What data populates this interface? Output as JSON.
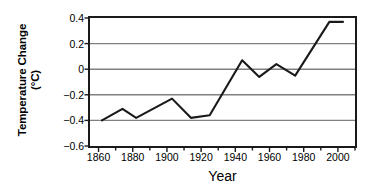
{
  "chart_data": {
    "type": "line",
    "title": "",
    "xlabel": "Year",
    "ylabel": "Temperature Change",
    "ylabel_units": "(°C)",
    "xlim": [
      1855,
      2010
    ],
    "ylim": [
      -0.6,
      0.4
    ],
    "grid": true,
    "grid_axis": "y",
    "legend": "none",
    "xticks": [
      1860,
      1880,
      1900,
      1920,
      1940,
      1960,
      1980,
      2000
    ],
    "xtick_labels": [
      "1860",
      "1880",
      "1900",
      "1920",
      "1940",
      "1960",
      "1980",
      "2000"
    ],
    "xminor_tick_interval": 10,
    "yticks": [
      0.4,
      0.2,
      0,
      -0.2,
      -0.4,
      -0.6
    ],
    "ytick_labels": [
      "0.4",
      "0.2",
      "0",
      "−0.2",
      "−0.4",
      "−0.6"
    ],
    "series": [
      {
        "name": "Global temperature anomaly",
        "color": "#1a1a1a",
        "x": [
          1862,
          1874,
          1882,
          1903,
          1914,
          1925,
          1944,
          1954,
          1964,
          1975,
          1995,
          2003
        ],
        "values": [
          -0.4,
          -0.31,
          -0.38,
          -0.23,
          -0.38,
          -0.36,
          0.07,
          -0.06,
          0.04,
          -0.05,
          0.37,
          0.37
        ]
      }
    ]
  },
  "style": {
    "frame_color": "#1a1a1a",
    "grid_color": "#808080",
    "line_color": "#1a1a1a",
    "background": "#ffffff"
  }
}
